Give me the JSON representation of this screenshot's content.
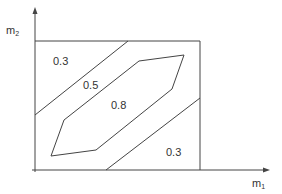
{
  "axes": {
    "x_label": "m",
    "x_sub": "1",
    "y_label": "m",
    "y_sub": "2"
  },
  "regions": [
    {
      "label": "0.3",
      "position": "upper-left"
    },
    {
      "label": "0.5",
      "position": "middle-band"
    },
    {
      "label": "0.8",
      "position": "center-polygon"
    },
    {
      "label": "0.3",
      "position": "lower-right"
    }
  ],
  "colors": {
    "stroke": "#444444",
    "text": "#333333",
    "background": "#ffffff"
  }
}
